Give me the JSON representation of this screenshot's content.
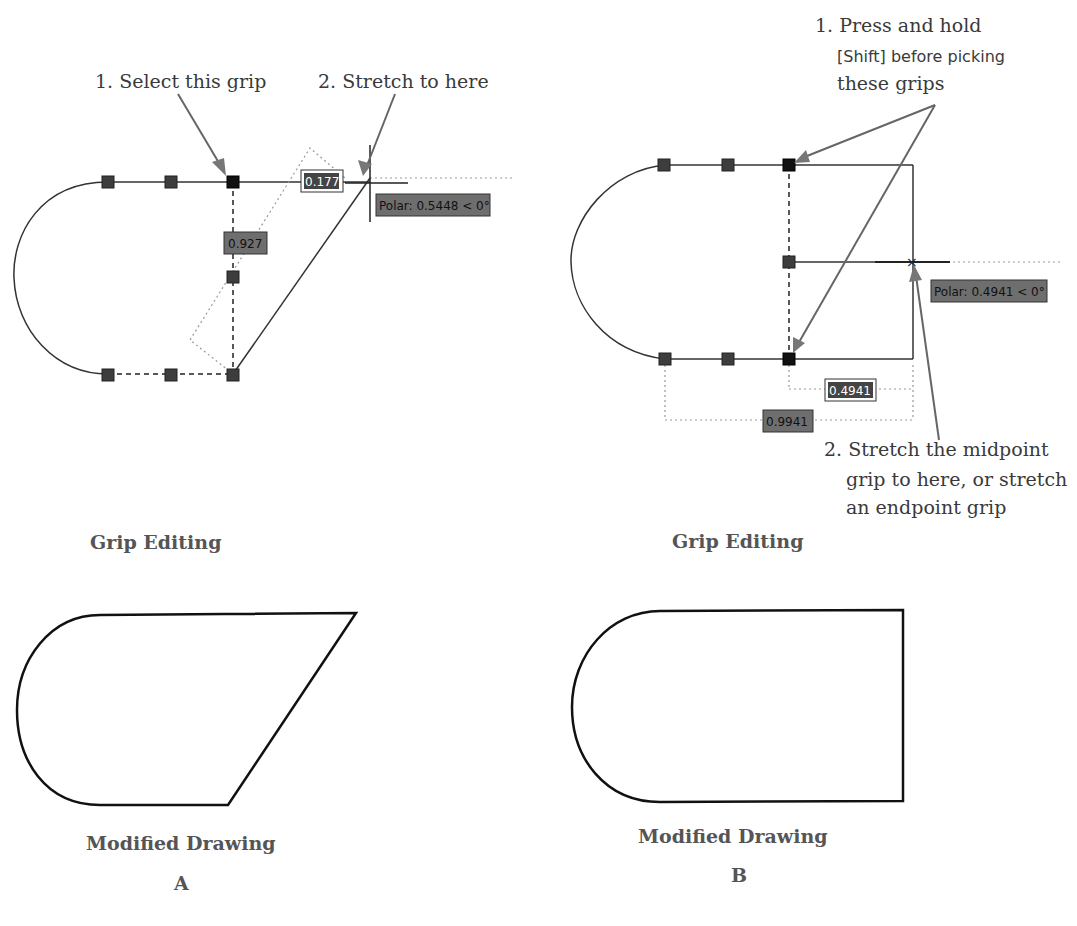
{
  "panel_a": {
    "callout_1": "1. Select this grip",
    "callout_2": "2. Stretch to here",
    "tooltip_distance": "0.177",
    "tooltip_length": "0.927",
    "tooltip_polar": "Polar: 0.5448 < 0°",
    "caption_grip": "Grip Editing",
    "caption_modified": "Modified Drawing",
    "label": "A"
  },
  "panel_b": {
    "callout_1_line1": "1. Press and hold",
    "callout_1_line2": "[Shift] before picking",
    "callout_1_line3": "these grips",
    "callout_2_line1": "2. Stretch the midpoint",
    "callout_2_line2": "grip to here, or stretch",
    "callout_2_line3": "an endpoint grip",
    "tooltip_polar": "Polar: 0.4941 < 0°",
    "tooltip_dim_inner": "0.4941",
    "tooltip_dim_outer": "0.9941",
    "caption_grip": "Grip Editing",
    "caption_modified": "Modified Drawing",
    "label": "B"
  },
  "colors": {
    "grip": "#3d3d3d",
    "tooltip": "#6e6e6e",
    "arrow": "#777777",
    "caption": "#555555"
  }
}
